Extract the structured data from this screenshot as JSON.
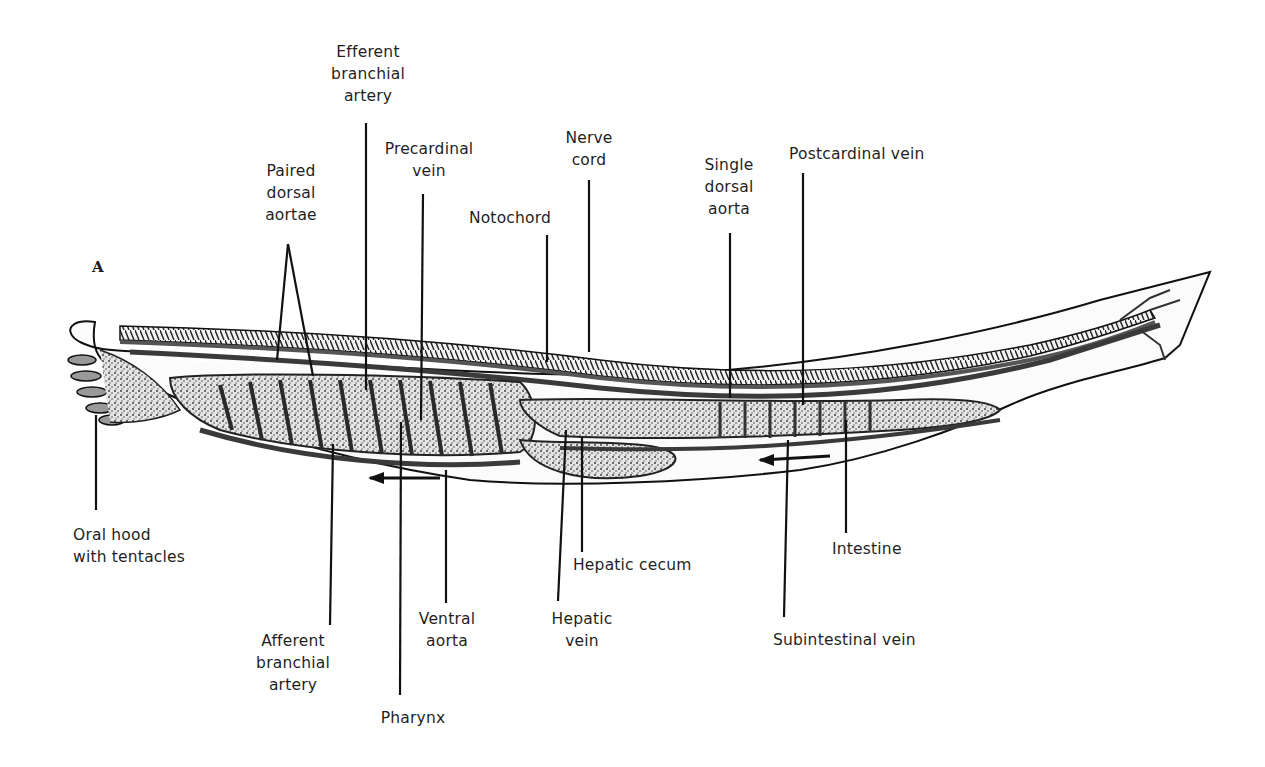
{
  "figure": {
    "panel_label": "A",
    "labels_top": {
      "efferent_branchial_artery": "Efferent\nbranchial\nartery",
      "paired_dorsal_aortae": "Paired\ndorsal\naortae",
      "precardinal_vein": "Precardinal\nvein",
      "notochord": "Notochord",
      "nerve_cord": "Nerve\ncord",
      "single_dorsal_aorta": "Single\ndorsal\naorta",
      "postcardinal_vein": "Postcardinal vein"
    },
    "labels_bottom": {
      "oral_hood": "Oral hood\nwith tentacles",
      "afferent_branchial_artery": "Afferent\nbranchial\nartery",
      "pharynx": "Pharynx",
      "ventral_aorta": "Ventral\naorta",
      "hepatic_vein": "Hepatic\nvein",
      "hepatic_cecum": "Hepatic cecum",
      "subintestinal_vein": "Subintestinal vein",
      "intestine": "Intestine"
    },
    "colors": {
      "ink": "#1a1a1a",
      "vessel": "#3a3a3a",
      "stipple": "#8a8a8a",
      "background": "#ffffff"
    }
  }
}
